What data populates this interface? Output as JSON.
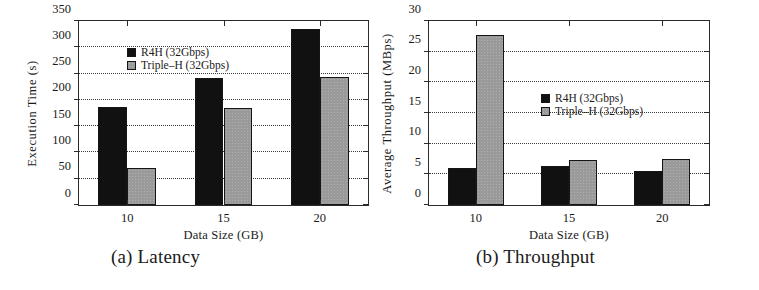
{
  "figure": {
    "panels": [
      {
        "caption": "(a) Latency",
        "xlabel": "Data Size (GB)",
        "ylabel": "Execution Time (s)"
      },
      {
        "caption": "(b) Throughput",
        "xlabel": "Data Size (GB)",
        "ylabel": "Average Throughput (MBps)"
      }
    ],
    "legend": {
      "series0": "R4H (32Gbps)",
      "series1": "Triple–H (32Gbps)"
    },
    "colors": {
      "series0": "#111111",
      "series1": "#9a9a9a",
      "axis": "#2b2b2b",
      "grid": "#3a3a3a",
      "background": "#ffffff"
    }
  },
  "chart_data": [
    {
      "type": "bar",
      "title": "(a) Latency",
      "xlabel": "Data Size (GB)",
      "ylabel": "Execution Time (s)",
      "categories": [
        "10",
        "15",
        "20"
      ],
      "yticks": [
        0,
        50,
        100,
        150,
        200,
        250,
        300,
        350
      ],
      "ylim": [
        0,
        350
      ],
      "grid": true,
      "legend_position": "upper-left-inside",
      "series": [
        {
          "name": "R4H (32Gbps)",
          "values": [
            187,
            241,
            335
          ]
        },
        {
          "name": "Triple–H (32Gbps)",
          "values": [
            70,
            185,
            243
          ]
        }
      ]
    },
    {
      "type": "bar",
      "title": "(b) Throughput",
      "xlabel": "Data Size (GB)",
      "ylabel": "Average Throughput (MBps)",
      "categories": [
        "10",
        "15",
        "20"
      ],
      "yticks": [
        0,
        5,
        10,
        15,
        20,
        25,
        30
      ],
      "ylim": [
        0,
        30
      ],
      "grid": true,
      "legend_position": "center-inside",
      "series": [
        {
          "name": "R4H (32Gbps)",
          "values": [
            6.0,
            6.3,
            5.5
          ]
        },
        {
          "name": "Triple–H (32Gbps)",
          "values": [
            27.8,
            7.4,
            7.5
          ]
        }
      ]
    }
  ]
}
